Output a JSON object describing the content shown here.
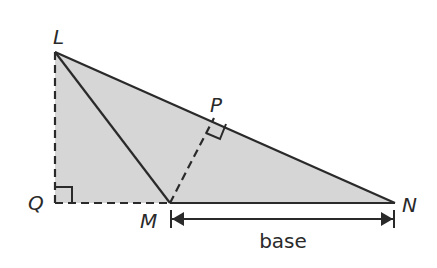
{
  "diagram": {
    "colors": {
      "fill": "#d6d6d6",
      "stroke": "#2a2a2a",
      "background": "#ffffff"
    },
    "points": {
      "L": {
        "label": "L",
        "x": 55,
        "y": 52
      },
      "Q": {
        "label": "Q",
        "x": 55,
        "y": 203
      },
      "M": {
        "label": "M",
        "x": 170,
        "y": 203
      },
      "N": {
        "label": "N",
        "x": 395,
        "y": 203
      },
      "P": {
        "label": "P",
        "x": 214,
        "y": 118
      }
    },
    "base_label": "base",
    "segments": [
      {
        "from": "L",
        "to": "N",
        "style": "solid"
      },
      {
        "from": "L",
        "to": "M",
        "style": "solid"
      },
      {
        "from": "M",
        "to": "N",
        "style": "solid"
      },
      {
        "from": "L",
        "to": "Q",
        "style": "dashed"
      },
      {
        "from": "Q",
        "to": "M",
        "style": "dashed"
      },
      {
        "from": "M",
        "to": "P",
        "style": "dashed"
      }
    ],
    "right_angles": [
      "Q",
      "P"
    ],
    "shaded_region": [
      "L",
      "Q",
      "N"
    ]
  }
}
